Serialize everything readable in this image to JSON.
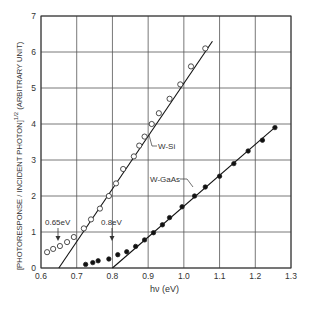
{
  "chart_data": {
    "type": "scatter",
    "title": "",
    "xlabel": "hν (eV)",
    "ylabel": "[PHOTORESPONSE / INCIDENT PHOTON]^1/2 (ARBITRARY UNIT)",
    "xlim": [
      0.6,
      1.3
    ],
    "ylim": [
      0,
      7
    ],
    "grid": true,
    "x_ticks": [
      "0.6",
      "0.7",
      "0.8",
      "0.9",
      "1.0",
      "1.1",
      "1.2",
      "1.3"
    ],
    "y_ticks": [
      "0",
      "1",
      "2",
      "3",
      "4",
      "5",
      "6",
      "7"
    ],
    "series": [
      {
        "name": "W-Si",
        "marker": "open-circle",
        "x": [
          0.617,
          0.634,
          0.653,
          0.673,
          0.692,
          0.72,
          0.74,
          0.765,
          0.79,
          0.81,
          0.83,
          0.86,
          0.875,
          0.89,
          0.91,
          0.93,
          0.96,
          0.99,
          1.02,
          1.06
        ],
        "y": [
          0.44,
          0.53,
          0.61,
          0.72,
          0.86,
          1.1,
          1.35,
          1.65,
          2.0,
          2.35,
          2.75,
          3.1,
          3.4,
          3.65,
          4.0,
          4.3,
          4.7,
          5.1,
          5.6,
          6.1
        ],
        "fit_line": {
          "x": [
            0.65,
            1.08
          ],
          "y": [
            0.0,
            6.3
          ]
        }
      },
      {
        "name": "W-GaAs",
        "marker": "filled-circle",
        "x": [
          0.725,
          0.745,
          0.76,
          0.79,
          0.815,
          0.84,
          0.865,
          0.89,
          0.915,
          0.94,
          0.96,
          0.995,
          1.03,
          1.06,
          1.1,
          1.14,
          1.18,
          1.22,
          1.255
        ],
        "y": [
          0.1,
          0.15,
          0.2,
          0.25,
          0.37,
          0.45,
          0.6,
          0.78,
          0.98,
          1.2,
          1.4,
          1.7,
          2.0,
          2.25,
          2.55,
          2.9,
          3.25,
          3.55,
          3.9
        ],
        "fit_line": {
          "x": [
            0.8,
            1.26
          ],
          "y": [
            0.0,
            3.95
          ]
        }
      }
    ],
    "annotations": [
      {
        "text": "0.65eV",
        "arrow_to_x": 0.65,
        "at_y": 0.75
      },
      {
        "text": "0.8eV",
        "arrow_to_x": 0.8,
        "at_y": 0.7
      },
      {
        "text": "W-Si",
        "points_to": "W-Si line near x=0.91"
      },
      {
        "text": "W-GaAs",
        "points_to": "W-GaAs line near x=1.04"
      }
    ]
  },
  "labels": {
    "xlabel": "hν (eV)",
    "ylabel_main": "PHOTORESPONSE / INCIDENT PHOTON",
    "ylabel_exp": "1/2",
    "ylabel_unit": "(ARBITRARY UNIT)",
    "ann_065": "0.65eV",
    "ann_08": "0.8eV",
    "series_wsi": "W-Si",
    "series_wgaas": "W-GaAs"
  }
}
